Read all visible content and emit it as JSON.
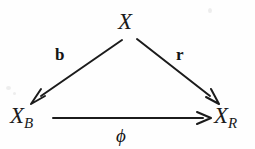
{
  "figure": {
    "kind": "commutative-triangle-diagram",
    "background_color": "#fefefe",
    "ink_color": "#1b1b1b"
  },
  "nodes": {
    "apex": {
      "base": "X",
      "subscript": ""
    },
    "bottom_left": {
      "base": "X",
      "subscript": "B"
    },
    "bottom_right": {
      "base": "X",
      "subscript": "R"
    }
  },
  "edges": {
    "left_diagonal": {
      "label": "b",
      "style": "bold",
      "from": "X",
      "to": "X_B"
    },
    "right_diagonal": {
      "label": "r",
      "style": "bold",
      "from": "X",
      "to": "X_R"
    },
    "bottom_horizontal": {
      "label": "ϕ",
      "style": "italic-greek",
      "from": "X_B",
      "to": "X_R"
    }
  }
}
